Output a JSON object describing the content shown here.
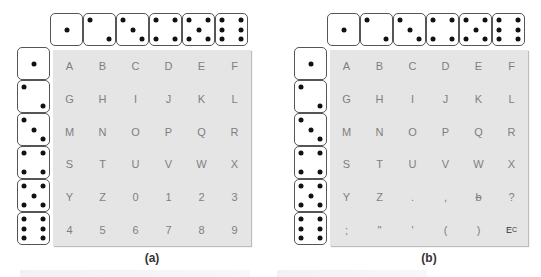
{
  "panels": [
    {
      "id": "a",
      "caption": "(a)",
      "top_dice": [
        1,
        2,
        3,
        4,
        5,
        6
      ],
      "left_dice": [
        1,
        2,
        3,
        4,
        5,
        6
      ],
      "grid": [
        [
          "A",
          "B",
          "C",
          "D",
          "E",
          "F"
        ],
        [
          "G",
          "H",
          "I",
          "J",
          "K",
          "L"
        ],
        [
          "M",
          "N",
          "O",
          "P",
          "Q",
          "R"
        ],
        [
          "S",
          "T",
          "U",
          "V",
          "W",
          "X"
        ],
        [
          "Y",
          "Z",
          "0",
          "1",
          "2",
          "3"
        ],
        [
          "4",
          "5",
          "6",
          "7",
          "8",
          "9"
        ]
      ]
    },
    {
      "id": "b",
      "caption": "(b)",
      "top_dice": [
        1,
        2,
        3,
        4,
        5,
        6
      ],
      "left_dice": [
        1,
        2,
        3,
        4,
        5,
        6
      ],
      "grid": [
        [
          "A",
          "B",
          "C",
          "D",
          "E",
          "F"
        ],
        [
          "G",
          "H",
          "I",
          "J",
          "K",
          "L"
        ],
        [
          "M",
          "N",
          "O",
          "P",
          "Q",
          "R"
        ],
        [
          "S",
          "T",
          "U",
          "V",
          "W",
          "X"
        ],
        [
          "Y",
          "Z",
          ".",
          ",",
          "b",
          "?"
        ],
        [
          ";",
          "\"",
          "'",
          "(",
          ")",
          "E_C"
        ]
      ],
      "special_cells": {
        "blank_symbol": "b",
        "escape_symbol": {
          "main": "E",
          "sub": "C"
        }
      }
    }
  ],
  "colors": {
    "grid_background": "#e5e5e5",
    "grid_text": "#7f7f7f",
    "die_border": "#555555",
    "pip": "#111111"
  }
}
